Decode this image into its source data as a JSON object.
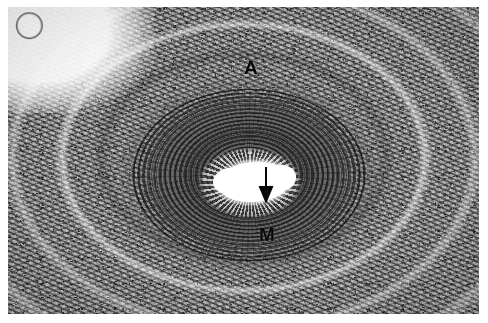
{
  "figure": {
    "type": "histology-micrograph",
    "staining": "grayscale",
    "background_color": "#ffffff",
    "plate_color": "#8d8d8d"
  },
  "annotations": {
    "adventitia_label": "A",
    "media_label": "M",
    "arrow_icon": "down-arrow-icon",
    "arrow_color": "#101010",
    "label_color": "#101010"
  },
  "regions": {
    "lumen": "lumen",
    "intima": "intima",
    "media": "media",
    "adventitia": "adventitia",
    "adipose": "adipose-tissue",
    "stroma": "connective-tissue-stroma"
  }
}
